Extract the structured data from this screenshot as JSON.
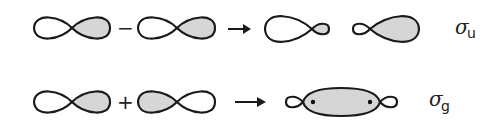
{
  "diagram": {
    "colors": {
      "shaded_lobe": "#d6d6d6",
      "outline": "#1a1a1a",
      "background": "#ffffff"
    },
    "rows": [
      {
        "id": "antibonding",
        "left_orbital": {
          "shaded_lobe": "right"
        },
        "operator": "−",
        "right_orbital": {
          "shaded_lobe": "right"
        },
        "arrow": "→",
        "results": [
          {
            "shape": "large white lobe left, small shaded lobe right"
          },
          {
            "shape": "small white lobe left, large shaded lobe right"
          }
        ],
        "label": {
          "symbol": "σ",
          "subscript": "u"
        }
      },
      {
        "id": "bonding",
        "left_orbital": {
          "shaded_lobe": "right"
        },
        "operator": "+",
        "right_orbital": {
          "shaded_lobe": "left"
        },
        "arrow": "→",
        "results": [
          {
            "shape": "small lobes at ends, large shaded central region with two nuclei"
          }
        ],
        "label": {
          "symbol": "σ",
          "subscript": "g"
        }
      }
    ]
  }
}
